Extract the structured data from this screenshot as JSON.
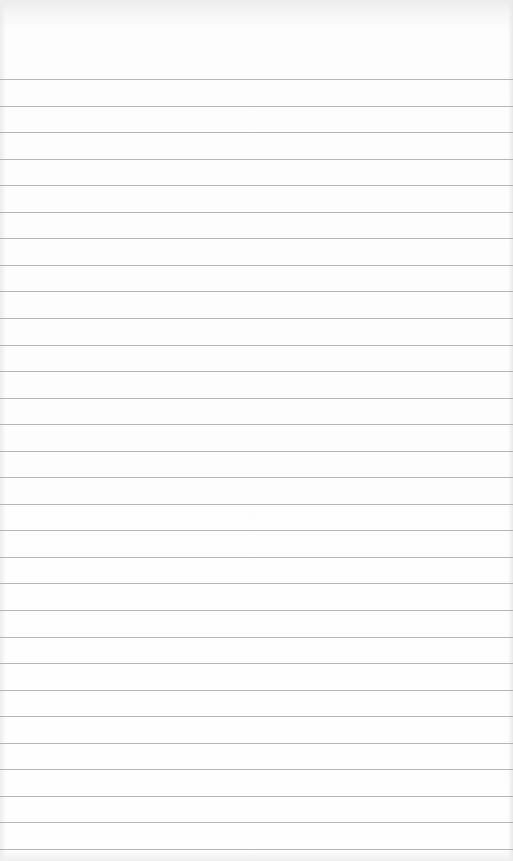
{
  "page": {
    "type": "ruled-paper",
    "background_color": "#fefefe",
    "rule_color": "#a9a9a9",
    "first_rule_y": 79,
    "rule_spacing": 26,
    "rule_count": 30,
    "text": ""
  }
}
